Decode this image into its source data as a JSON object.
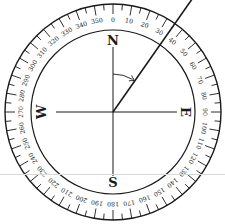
{
  "diagram": {
    "center": [
      113,
      112
    ],
    "outer_radius": 108,
    "inner_radius": 82,
    "cardinals": [
      {
        "label": "N",
        "angle": 0
      },
      {
        "label": "E",
        "angle": 90
      },
      {
        "label": "S",
        "angle": 180
      },
      {
        "label": "W",
        "angle": 270
      }
    ],
    "degree_labels": [
      "0",
      "10",
      "20",
      "30",
      "40",
      "50",
      "60",
      "70",
      "80",
      "90",
      "100",
      "110",
      "120",
      "130",
      "140",
      "150",
      "160",
      "170",
      "180",
      "190",
      "200",
      "210",
      "220",
      "230",
      "240",
      "250",
      "260",
      "270",
      "280",
      "290",
      "300",
      "310",
      "320",
      "330",
      "340",
      "350"
    ],
    "bearing_angle_deg": 35,
    "colors": {
      "ink": "#1a1a1a",
      "background": "#ffffff",
      "divider": "#d8d8d8"
    }
  }
}
